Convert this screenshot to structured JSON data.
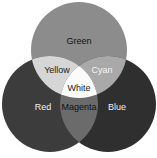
{
  "diagram": {
    "type": "venn",
    "circles": [
      {
        "id": "green",
        "label": "Green",
        "cx": 79,
        "cy": 50,
        "r": 48,
        "fill": "#8c8c8c"
      },
      {
        "id": "red",
        "label": "Red",
        "cx": 50,
        "cy": 104,
        "r": 48,
        "fill": "#3c3c3c"
      },
      {
        "id": "blue",
        "label": "Blue",
        "cx": 108,
        "cy": 104,
        "r": 48,
        "fill": "#2f2f2f"
      }
    ],
    "overlaps": [
      {
        "id": "yellow",
        "label": "Yellow",
        "sets": [
          "red",
          "green"
        ],
        "fill": "#d6d6d6"
      },
      {
        "id": "cyan",
        "label": "Cyan",
        "sets": [
          "green",
          "blue"
        ],
        "fill": "#a9a9a9"
      },
      {
        "id": "magenta",
        "label": "Magenta",
        "sets": [
          "red",
          "blue"
        ],
        "fill": "#6b6b6b"
      },
      {
        "id": "white",
        "label": "White",
        "sets": [
          "red",
          "green",
          "blue"
        ],
        "fill": "#fbfbfb"
      }
    ],
    "text_colors": {
      "green": "#111111",
      "red": "#f0f0f0",
      "blue": "#f0f0f0",
      "yellow": "#222222",
      "cyan": "#f5f5f5",
      "magenta": "#111111",
      "white": "#222222"
    }
  }
}
